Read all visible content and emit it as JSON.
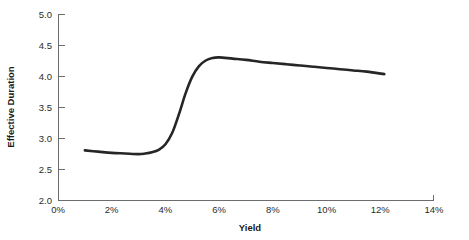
{
  "chart_data": {
    "type": "line",
    "title": "",
    "xlabel": "Yield",
    "ylabel": "Effective Duration",
    "xlim": [
      0,
      14
    ],
    "ylim": [
      2.0,
      5.0
    ],
    "grid": false,
    "legend": "none",
    "x_tick_labels": [
      "0%",
      "2%",
      "4%",
      "6%",
      "8%",
      "10%",
      "12%",
      "14%"
    ],
    "x_tick_values": [
      0,
      2,
      4,
      6,
      8,
      10,
      12,
      14
    ],
    "y_tick_labels": [
      "2.0",
      "2.5",
      "3.0",
      "3.5",
      "4.0",
      "4.5",
      "5.0"
    ],
    "y_tick_values": [
      2.0,
      2.5,
      3.0,
      3.5,
      4.0,
      4.5,
      5.0
    ],
    "series": [
      {
        "name": "Effective Duration",
        "color": "#262626",
        "x": [
          1.0,
          1.5,
          2.0,
          2.5,
          3.0,
          3.25,
          3.5,
          3.75,
          4.0,
          4.25,
          4.5,
          4.75,
          5.0,
          5.25,
          5.5,
          5.75,
          6.0,
          6.5,
          7.0,
          7.5,
          8.0,
          8.5,
          9.0,
          9.5,
          10.0,
          10.5,
          11.0,
          11.5,
          12.15
        ],
        "y": [
          2.8,
          2.78,
          2.76,
          2.75,
          2.74,
          2.75,
          2.77,
          2.81,
          2.9,
          3.08,
          3.38,
          3.72,
          3.99,
          4.16,
          4.25,
          4.29,
          4.3,
          4.28,
          4.26,
          4.23,
          4.21,
          4.19,
          4.17,
          4.15,
          4.13,
          4.11,
          4.09,
          4.07,
          4.03
        ]
      }
    ]
  },
  "axes": {
    "y_axis_name": "y-axis",
    "x_axis_name": "x-axis"
  }
}
